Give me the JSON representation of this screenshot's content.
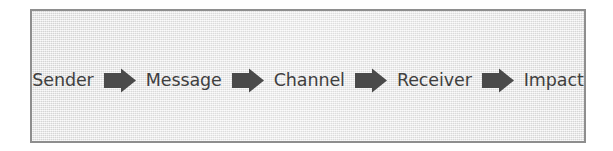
{
  "figure": {
    "type": "process-flow",
    "orientation": "horizontal",
    "panel": {
      "background_color": "#e4e4e4",
      "border_color": "#8e8e8e",
      "texture": "fine woven paper grid"
    },
    "text_color": "#3f3f3f",
    "arrow_color": "#4a4a4a",
    "connector_icon": "right-arrow-icon",
    "steps": [
      {
        "label": "Sender"
      },
      {
        "label": "Message"
      },
      {
        "label": "Channel"
      },
      {
        "label": "Receiver"
      },
      {
        "label": "Impact"
      }
    ]
  }
}
